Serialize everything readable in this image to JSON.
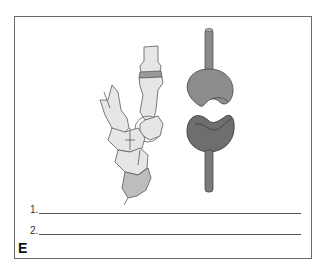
{
  "figure": {
    "panel_letter": "E",
    "answer_lines": [
      {
        "number": "1.",
        "value": ""
      },
      {
        "number": "2.",
        "value": ""
      }
    ],
    "illustrations": {
      "left": "hand-bones-thumb-carpometacarpal-joint",
      "right": "saddle-joint-model"
    },
    "colors": {
      "frame": "#6a6a6a",
      "bone_fill": "#e6e6e6",
      "bone_outline": "#5a5a5a",
      "model_upper": "#8c8c8c",
      "model_lower": "#6e6e6e",
      "rod": "#8a8a8a"
    }
  }
}
